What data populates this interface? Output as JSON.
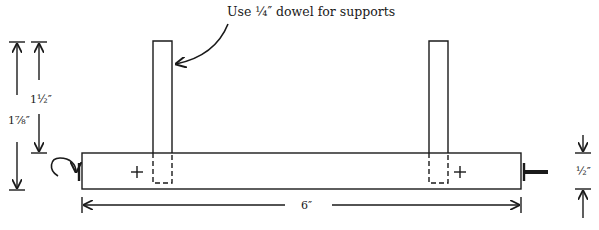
{
  "diagram": {
    "annotation": "Use ¼″ dowel for supports",
    "dimensions": {
      "overall_height": "1⅞″",
      "support_height": "1½″",
      "bar_length": "6″",
      "bar_thickness": "½″"
    },
    "parts": [
      {
        "name": "main bar",
        "type": "rectangle"
      },
      {
        "name": "left support dowel",
        "type": "dowel"
      },
      {
        "name": "right support dowel",
        "type": "dowel"
      },
      {
        "name": "left pivot marker",
        "type": "plus"
      },
      {
        "name": "right pivot marker",
        "type": "plus"
      },
      {
        "name": "crank handle",
        "type": "curved-arrow"
      },
      {
        "name": "axle pin",
        "type": "pin"
      }
    ],
    "colors": {
      "ink": "#1a1a1a",
      "background": "#ffffff"
    }
  }
}
